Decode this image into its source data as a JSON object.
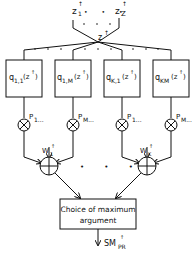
{
  "diagram": {
    "inputs": {
      "first": "z",
      "first_sup": "↑",
      "first_sub": "1",
      "last": "z",
      "last_sup": "↑",
      "last_sub": "Z",
      "dots": "• • •",
      "sep": ","
    },
    "merged": {
      "label": "z",
      "sup": "↑"
    },
    "boxes": [
      {
        "q": "q",
        "sub": "1,1",
        "arg": "(z",
        "argsup": "↑",
        "close": ")"
      },
      {
        "q": "q",
        "sub": "1,M",
        "arg": "(z",
        "argsup": "↑",
        "close": ")"
      },
      {
        "q": "q",
        "sub": "K,1",
        "arg": "(z",
        "argsup": "↑",
        "close": ")"
      },
      {
        "q": "q",
        "sub": "KM",
        "arg": "(z",
        "argsup": "↑",
        "close": ")"
      }
    ],
    "multipliers": [
      {
        "label": "P",
        "sub": "1..."
      },
      {
        "label": "P",
        "sub": "M..."
      },
      {
        "label": "P",
        "sub": "1..."
      },
      {
        "label": "P",
        "sub": "M..."
      }
    ],
    "adders": [
      {
        "label": "W",
        "sup": "↑",
        "sub": "1"
      },
      {
        "label": "W",
        "sup": "↑",
        "sub": "K"
      }
    ],
    "between_dots": "• • •",
    "final_box": {
      "line1": "Choice of maximum",
      "line2": "argument"
    },
    "output": {
      "label": "SM",
      "sup": "↑",
      "sub": "PR"
    }
  }
}
